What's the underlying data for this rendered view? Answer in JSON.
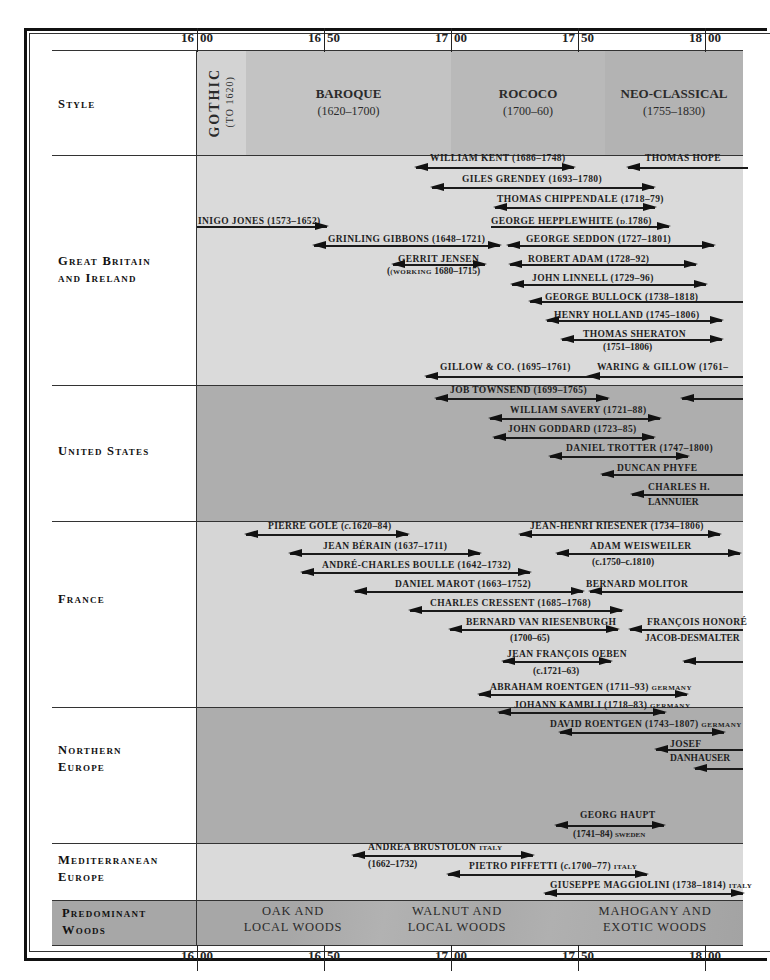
{
  "caption": "",
  "axis": {
    "ticks": [
      {
        "century": "16",
        "decade": "00",
        "year": 1600
      },
      {
        "century": "16",
        "decade": "50",
        "year": 1650
      },
      {
        "century": "17",
        "decade": "00",
        "year": 1700
      },
      {
        "century": "17",
        "decade": "50",
        "year": 1750
      },
      {
        "century": "18",
        "decade": "00",
        "year": 1800
      }
    ]
  },
  "rows": {
    "style": "Style",
    "gb1": "Great Britain",
    "gb2": "and Ireland",
    "us": "United States",
    "france": "France",
    "ne1": "Northern",
    "ne2": "Europe",
    "med1": "Mediterranean",
    "med2": "Europe",
    "woods1": "Predominant",
    "woods2": "Woods"
  },
  "styles": [
    {
      "name": "GOTHIC",
      "dates": "(TO 1620)"
    },
    {
      "name": "BAROQUE",
      "dates": "(1620–1700)"
    },
    {
      "name": "ROCOCO",
      "dates": "(1700–60)"
    },
    {
      "name": "NEO-CLASSICAL",
      "dates": "(1755–1830)"
    }
  ],
  "woods": [
    {
      "line1": "OAK AND",
      "line2": "LOCAL WOODS"
    },
    {
      "line1": "WALNUT AND",
      "line2": "LOCAL WOODS"
    },
    {
      "line1": "MAHOGANY AND",
      "line2": "EXOTIC WOODS"
    }
  ],
  "colors": {
    "gothic": "#d2d2d2",
    "baroque": "#c4c4c4",
    "rococo": "#b9b9b9",
    "neoclassical": "#b2b2b2",
    "light_band": "#d9d9d9",
    "dark_band": "#aeaeae",
    "line": "#1a1a1a"
  },
  "makers": {
    "gb": [
      {
        "label": "WILLIAM KENT (1686–1748)"
      },
      {
        "label": "THOMAS HOPE"
      },
      {
        "label": "GILES GRENDEY (1693–1780)"
      },
      {
        "label": "THOMAS CHIPPENDALE (1718–79)"
      },
      {
        "label": "INIGO JONES (1573–1652)"
      },
      {
        "label": "GEORGE HEPPLEWHITE (",
        "small": "D.",
        "tail": "1786)"
      },
      {
        "label": "GRINLING GIBBONS (1648–1721)"
      },
      {
        "label": "GEORGE SEDDON (1727–1801)"
      },
      {
        "label": "GERRIT JENSEN",
        "line2_small": "(WORKING",
        "line2": " 1680–1715)"
      },
      {
        "label": "ROBERT ADAM (1728–92)"
      },
      {
        "label": "JOHN LINNELL (1729–96)"
      },
      {
        "label": "GEORGE BULLOCK (1738–1818)"
      },
      {
        "label": "HENRY HOLLAND (1745–1806)"
      },
      {
        "label": "THOMAS SHERATON",
        "line2": "(1751–1806)"
      },
      {
        "label": "GILLOW & CO. (1695–1761)"
      },
      {
        "label": "WARING & GILLOW (1761–"
      }
    ],
    "us": [
      {
        "label": "JOB TOWNSEND (1699–1765)"
      },
      {
        "label": "WILLIAM SAVERY (1721–88)"
      },
      {
        "label": "JOHN GODDARD (1723–85)"
      },
      {
        "label": "DANIEL TROTTER (1747–1800)"
      },
      {
        "label": "DUNCAN PHYFE"
      },
      {
        "label": "CHARLES H.",
        "line2": "LANNUIER"
      }
    ],
    "france": [
      {
        "label": "PIERRE GOLE (",
        "it": "c.",
        "tail": "1620–84)"
      },
      {
        "label": "JEAN-HENRI RIESENER (1734–1806)"
      },
      {
        "label": "JEAN BÉRAIN (1637–1711)"
      },
      {
        "label": "ADAM WEISWEILER",
        "line2_it": "c.",
        "line2": "1750–",
        "line2_it2": "c.",
        "line2_tail": "1810)"
      },
      {
        "label": "ANDRÉ-CHARLES BOULLE (1642–1732)"
      },
      {
        "label": "DANIEL MAROT (1663–1752)"
      },
      {
        "label": "BERNARD MOLITOR"
      },
      {
        "label": "CHARLES CRESSENT (1685–1768)"
      },
      {
        "label": "BERNARD VAN RIESENBURGH",
        "line2": "(1700–65)"
      },
      {
        "label": "FRANÇOIS HONORÉ",
        "line2": "JACOB-DESMALTER"
      },
      {
        "label": "JEAN FRANÇOIS OEBEN",
        "line2_it": "c.",
        "line2": "1721–63)"
      }
    ],
    "northern": [
      {
        "label": "ABRAHAM ROENTGEN (1711–93)",
        "small": "GERMANY"
      },
      {
        "label": "JOHANN KAMBLI (1718–83)",
        "small": "GERMANY"
      },
      {
        "label": "DAVID ROENTGEN (1743–1807)",
        "small": "GERMANY"
      },
      {
        "label": "JOSEF",
        "line2": "DANHAUSER"
      },
      {
        "label": "GEORG HAUPT",
        "line2": "(1741–84)",
        "line2_small": "SWEDEN"
      }
    ],
    "mediterranean": [
      {
        "label": "ANDREA BRUSTOLON",
        "small": "ITALY",
        "line2": "(1662–1732)"
      },
      {
        "label": "PIETRO PIFFETTI (",
        "it": "c.",
        "tail": "1700–77)",
        "small": "ITALY"
      },
      {
        "label": "GIUSEPPE MAGGIOLINI (1738–1814)",
        "small": "ITALY"
      }
    ]
  }
}
